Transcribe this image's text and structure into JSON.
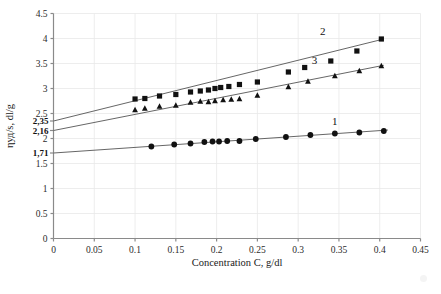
{
  "chart_data": {
    "type": "scatter",
    "title": "",
    "xlabel": "Concentration C, g/dl",
    "ylabel": "ηуд/s, dl/g",
    "xlim": [
      0,
      0.45
    ],
    "ylim": [
      0,
      4.5
    ],
    "xticks": [
      "0",
      "0.05",
      "0.1",
      "0.15",
      "0.2",
      "0.25",
      "0.3",
      "0.35",
      "0.4",
      "0.45"
    ],
    "xtick_values": [
      0,
      0.05,
      0.1,
      0.15,
      0.2,
      0.25,
      0.3,
      0.35,
      0.4,
      0.45
    ],
    "yticks": [
      "0",
      "0.5",
      "1",
      "1.5",
      "2",
      "2.5",
      "3",
      "3.5",
      "4",
      "4.5"
    ],
    "ytick_values": [
      0,
      0.5,
      1,
      1.5,
      2,
      2.5,
      3,
      3.5,
      4,
      4.5
    ],
    "grid": true,
    "legend_position": "inline-labels",
    "intercept_annotations": [
      {
        "label": "2,35",
        "value": 2.35,
        "series": "2"
      },
      {
        "label": "2,16",
        "value": 2.16,
        "series": "3"
      },
      {
        "label": "1,71",
        "value": 1.71,
        "series": "1"
      }
    ],
    "series": [
      {
        "name": "1",
        "marker": "circle",
        "label": "1",
        "label_x": 0.345,
        "label_y": 2.28,
        "intercept": 1.71,
        "slope": 1.12,
        "fit_x": [
          0.0,
          0.41
        ],
        "x": [
          0.12,
          0.148,
          0.168,
          0.185,
          0.195,
          0.203,
          0.213,
          0.228,
          0.248,
          0.285,
          0.315,
          0.345,
          0.375,
          0.405
        ],
        "y": [
          1.84,
          1.88,
          1.9,
          1.93,
          1.94,
          1.94,
          1.95,
          1.95,
          1.99,
          2.03,
          2.07,
          2.1,
          2.12,
          2.15
        ]
      },
      {
        "name": "2",
        "marker": "square",
        "label": "2",
        "label_x": 0.33,
        "label_y": 4.07,
        "intercept": 2.35,
        "slope": 4.05,
        "fit_x": [
          0.0,
          0.405
        ],
        "x": [
          0.1,
          0.112,
          0.13,
          0.15,
          0.168,
          0.18,
          0.19,
          0.198,
          0.205,
          0.215,
          0.228,
          0.25,
          0.288,
          0.308,
          0.34,
          0.372,
          0.402
        ],
        "y": [
          2.79,
          2.8,
          2.85,
          2.88,
          2.93,
          2.95,
          2.97,
          3.0,
          3.02,
          3.04,
          3.08,
          3.13,
          3.33,
          3.42,
          3.55,
          3.75,
          3.99
        ]
      },
      {
        "name": "3",
        "marker": "triangle",
        "label": "3",
        "label_x": 0.32,
        "label_y": 3.49,
        "intercept": 2.16,
        "slope": 3.22,
        "fit_x": [
          0.0,
          0.405
        ],
        "x": [
          0.1,
          0.112,
          0.13,
          0.15,
          0.168,
          0.18,
          0.19,
          0.198,
          0.208,
          0.218,
          0.228,
          0.25,
          0.288,
          0.312,
          0.345,
          0.375,
          0.402
        ],
        "y": [
          2.57,
          2.6,
          2.64,
          2.66,
          2.72,
          2.74,
          2.73,
          2.75,
          2.77,
          2.78,
          2.79,
          2.86,
          3.03,
          3.14,
          3.25,
          3.35,
          3.45
        ]
      }
    ]
  },
  "axes": {
    "x_title": "Concentration C, g/dl",
    "y_title": "ηуд/s, dl/g"
  }
}
